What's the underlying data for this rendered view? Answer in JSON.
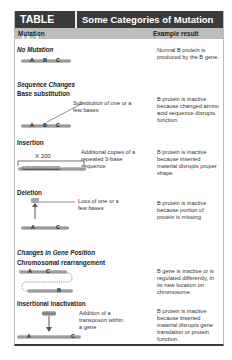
{
  "table": {
    "number": "TABLE 11.1",
    "title": "Some Categories of Mutation",
    "columns": [
      "Mutation",
      "Example result"
    ]
  },
  "rows": [
    {
      "type": "section",
      "label": "No Mutation",
      "result": "Normal B protein is produced by the B gene.",
      "genes": [
        "A",
        "B",
        "C"
      ]
    },
    {
      "type": "header",
      "label": "Sequence Changes"
    },
    {
      "type": "item",
      "label": "Base substitution",
      "note": "Substitution of one or a few bases",
      "result": "B protein is inactive because changed amino acid sequence disrupts function.",
      "genes": [
        "A",
        "B",
        "C"
      ]
    },
    {
      "type": "item",
      "label": "Insertion",
      "note": "Additional copies of a repeated 3-base sequence",
      "multiplier": "X 200",
      "repeat": "CCCCCCCCCCCC",
      "result": "B protein is inactive because inserted material disrupts proper shape."
    },
    {
      "type": "item",
      "label": "Deletion",
      "note": "Loss of one or a few bases",
      "result": "B protein is inactive because portion of protein is missing.",
      "genes": [
        "A",
        "C"
      ],
      "removed": "B"
    },
    {
      "type": "header",
      "label": "Changes in Gene Position"
    },
    {
      "type": "item",
      "label": "Chromosomal rearrangement",
      "result": "B gene is inactive or is regulated differently, in its new location on chromosome.",
      "genes": [
        "A",
        "C",
        "B"
      ]
    },
    {
      "type": "item",
      "label": "Insertional inactivation",
      "note": "Addition of a transposon within a gene",
      "result": "B protein is inactive because inserted material disrupts gene translation or protein function.",
      "genes": [
        "A",
        "C"
      ]
    }
  ]
}
